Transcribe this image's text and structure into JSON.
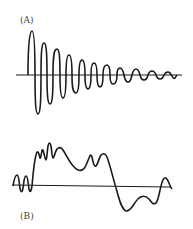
{
  "figure": {
    "panels": [
      {
        "id": "A",
        "label": "(A)",
        "description": "Damped oscillation decaying toward the baseline",
        "baseline": {
          "x1": 16,
          "x2": 182,
          "y": 75
        }
      },
      {
        "id": "B",
        "label": "(B)",
        "description": "Irregular complex waveform crossing the baseline",
        "baseline": {
          "x1": 12,
          "x2": 170,
          "y": 186
        }
      }
    ],
    "colors": {
      "stroke": "#1a1a1a",
      "background": "#ffffff",
      "label": "#444444"
    }
  }
}
